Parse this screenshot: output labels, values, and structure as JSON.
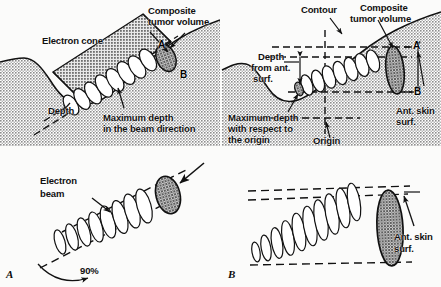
{
  "figure": {
    "panels": [
      {
        "id": "panel-a-top",
        "caption": "",
        "labels": [
          {
            "name": "composite-tumor-volume",
            "text": "Composite\ntumor volume"
          },
          {
            "name": "electron-cone",
            "text": "Electron cone"
          },
          {
            "name": "depth",
            "text": "Depth"
          },
          {
            "name": "maximum-depth-beam-direction",
            "text": "Maximum depth\nin the beam direction"
          },
          {
            "name": "point-a",
            "text": "A"
          },
          {
            "name": "point-b",
            "text": "B"
          }
        ]
      },
      {
        "id": "panel-b-top",
        "caption": "",
        "labels": [
          {
            "name": "contour",
            "text": "Contour"
          },
          {
            "name": "composite-tumor-volume",
            "text": "Composite\ntumor volume"
          },
          {
            "name": "depth-from-ant-surf",
            "text": "Depth\nfrom ant.\nsurf."
          },
          {
            "name": "maximum-depth-origin",
            "text": "Maximum depth\nwith respect to\nthe origin"
          },
          {
            "name": "origin",
            "text": "Origin"
          },
          {
            "name": "ant-skin-surf",
            "text": "Ant. skin\nsurf."
          },
          {
            "name": "point-a",
            "text": "A"
          },
          {
            "name": "point-b",
            "text": "B"
          }
        ]
      },
      {
        "id": "panel-a-bottom",
        "caption": "A",
        "labels": [
          {
            "name": "electron-beam",
            "text": "Electron\nbeam"
          },
          {
            "name": "ninety-percent",
            "text": "90%"
          }
        ]
      },
      {
        "id": "panel-b-bottom",
        "caption": "B",
        "labels": [
          {
            "name": "ant-skin-surf",
            "text": "Ant. skin\nsurf."
          }
        ]
      }
    ],
    "text": {
      "composite_tumor_volume_l1": "Composite",
      "composite_tumor_volume_l2": "tumor volume",
      "electron_cone": "Electron cone",
      "depth": "Depth",
      "max_depth_beam_l1": "Maximum depth",
      "max_depth_beam_l2": "in the beam direction",
      "point_a": "A",
      "point_b": "B",
      "contour": "Contour",
      "composite_tumor_volume_r1": "Composite",
      "composite_tumor_volume_r2": "tumor volume",
      "depth_ant_l1": "Depth",
      "depth_ant_l2": "from ant.",
      "depth_ant_l3": "surf.",
      "max_depth_origin_l1": "Maximum depth",
      "max_depth_origin_l2": "with respect to",
      "max_depth_origin_l3": "the origin",
      "origin": "Origin",
      "ant_skin_surf_1": "Ant. skin",
      "ant_skin_surf_2": "surf.",
      "point_a_r": "A",
      "point_b_r": "B",
      "electron_beam_l1": "Electron",
      "electron_beam_l2": "beam",
      "ninety_percent": "90%",
      "ant_skin_surf_b1": "Ant. skin",
      "ant_skin_surf_b2": "surf.",
      "caption_a": "A",
      "caption_b": "B"
    },
    "colors": {
      "tissue_fill": "#b9b9b9",
      "tumor_fill": "#8e8e8e",
      "cone_fill": "#a8a8a8",
      "line": "#121212",
      "paper": "#fbfbfa"
    }
  }
}
